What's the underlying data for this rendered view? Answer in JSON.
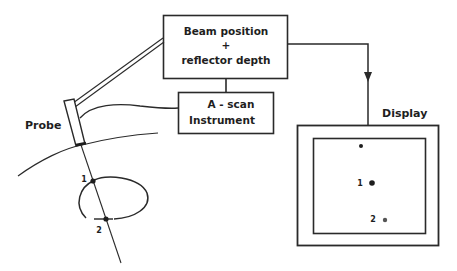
{
  "diagram": {
    "type": "block-diagram",
    "colors": {
      "line": "#2a2a2a",
      "text": "#1e1e1e",
      "background": "#ffffff"
    },
    "blocks": {
      "beam": {
        "line1": "Beam  position",
        "line2": "+",
        "line3": "reflector  depth"
      },
      "ascan": {
        "line1": "A - scan",
        "line2": "Instrument"
      },
      "display": {
        "label": "Display"
      }
    },
    "labels": {
      "probe": "Probe",
      "point1": "1",
      "point2": "2",
      "display_point1": "1",
      "display_point2": "2"
    },
    "connections": [
      {
        "from": "probe",
        "to": "beam",
        "style": "double-line arm"
      },
      {
        "from": "probe",
        "to": "ascan",
        "style": "cable"
      },
      {
        "from": "ascan",
        "to": "beam",
        "style": "line"
      },
      {
        "from": "beam",
        "to": "display",
        "style": "arrow"
      }
    ]
  }
}
